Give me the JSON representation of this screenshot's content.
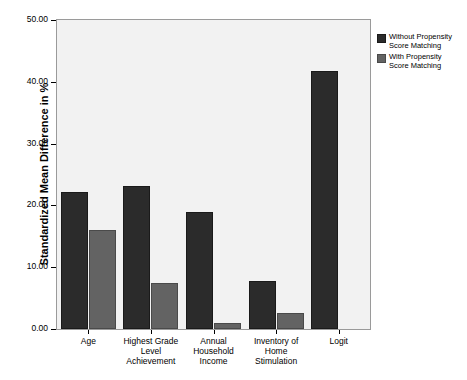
{
  "chart_data": {
    "type": "bar",
    "title": "",
    "xlabel": "",
    "ylabel": "Standardized Mean Difference in %",
    "ylim": [
      0,
      50
    ],
    "yticks": [
      "0.00",
      "10.00",
      "20.00",
      "30.00",
      "40.00",
      "50.00"
    ],
    "ytick_values": [
      0,
      10,
      20,
      30,
      40,
      50
    ],
    "grid": false,
    "legend_position": "right",
    "categories": [
      "Age",
      "Highest Grade Level Achievement",
      "Annual Household Income",
      "Inventory of Home Stimulation",
      "Logit"
    ],
    "category_lines": [
      [
        "Age"
      ],
      [
        "Highest Grade",
        "Level",
        "Achievement"
      ],
      [
        "Annual",
        "Household",
        "Income"
      ],
      [
        "Inventory of",
        "Home",
        "Stimulation"
      ],
      [
        "Logit"
      ]
    ],
    "series": [
      {
        "name": "Without Propensity Score Matching",
        "color": "#2b2b2b",
        "values": [
          22.2,
          23.2,
          19.0,
          7.8,
          41.7
        ]
      },
      {
        "name": "With Propensity Score Matching",
        "color": "#636363",
        "values": [
          16.0,
          7.4,
          1.0,
          2.6,
          0.0
        ]
      }
    ]
  },
  "legend": {
    "items": [
      {
        "label": "Without Propensity\nScore Matching",
        "color": "#2b2b2b"
      },
      {
        "label": "With Propensity\nScore Matching",
        "color": "#636363"
      }
    ]
  }
}
